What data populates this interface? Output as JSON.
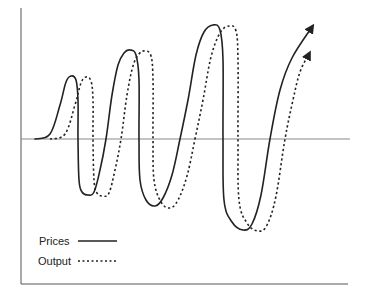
{
  "chart_data": {
    "type": "line",
    "title": "",
    "xlabel": "",
    "ylabel": "",
    "grid": false,
    "legend_position": "bottom-left inside",
    "axes": {
      "frame": "left and bottom borders",
      "zero_line": true
    },
    "series": [
      {
        "name": "Prices",
        "style": "solid",
        "color": "#222222",
        "arrow_end": true,
        "description": "Oscillation with growing amplitude, leading Output by about a quarter cycle",
        "peaks": [
          {
            "x": 71,
            "y": 76
          },
          {
            "x": 130,
            "y": 50
          },
          {
            "x": 213,
            "y": 25
          }
        ],
        "troughs": [
          {
            "x": 88,
            "y": 195
          },
          {
            "x": 155,
            "y": 206
          },
          {
            "x": 243,
            "y": 230
          }
        ],
        "points": [
          [
            35,
            139
          ],
          [
            50,
            134
          ],
          [
            60,
            105
          ],
          [
            66,
            82
          ],
          [
            71,
            76
          ],
          [
            76,
            80
          ],
          [
            78,
            100
          ],
          [
            78,
            139
          ],
          [
            79,
            180
          ],
          [
            82,
            192
          ],
          [
            88,
            195
          ],
          [
            94,
            192
          ],
          [
            100,
            170
          ],
          [
            106,
            139
          ],
          [
            112,
            95
          ],
          [
            118,
            65
          ],
          [
            124,
            53
          ],
          [
            130,
            50
          ],
          [
            136,
            55
          ],
          [
            139,
            80
          ],
          [
            139,
            139
          ],
          [
            140,
            180
          ],
          [
            146,
            200
          ],
          [
            155,
            206
          ],
          [
            163,
            198
          ],
          [
            172,
            175
          ],
          [
            180,
            139
          ],
          [
            188,
            100
          ],
          [
            196,
            55
          ],
          [
            204,
            32
          ],
          [
            213,
            25
          ],
          [
            220,
            30
          ],
          [
            223,
            60
          ],
          [
            223,
            139
          ],
          [
            224,
            200
          ],
          [
            232,
            222
          ],
          [
            243,
            230
          ],
          [
            252,
            224
          ],
          [
            261,
            195
          ],
          [
            270,
            139
          ],
          [
            280,
            90
          ],
          [
            292,
            58
          ],
          [
            312,
            27
          ]
        ]
      },
      {
        "name": "Output",
        "style": "dashed",
        "color": "#222222",
        "arrow_end": true,
        "description": "Oscillation with growing amplitude, lagging Prices by about a quarter cycle",
        "peaks": [
          {
            "x": 86,
            "y": 77
          },
          {
            "x": 145,
            "y": 51
          },
          {
            "x": 229,
            "y": 26
          }
        ],
        "troughs": [
          {
            "x": 103,
            "y": 196
          },
          {
            "x": 170,
            "y": 208
          },
          {
            "x": 258,
            "y": 231
          }
        ],
        "points": [
          [
            50,
            139
          ],
          [
            65,
            134
          ],
          [
            75,
            105
          ],
          [
            81,
            83
          ],
          [
            86,
            77
          ],
          [
            91,
            81
          ],
          [
            93,
            100
          ],
          [
            93,
            139
          ],
          [
            94,
            180
          ],
          [
            97,
            193
          ],
          [
            103,
            196
          ],
          [
            109,
            193
          ],
          [
            115,
            170
          ],
          [
            121,
            139
          ],
          [
            127,
            95
          ],
          [
            133,
            66
          ],
          [
            139,
            54
          ],
          [
            145,
            51
          ],
          [
            151,
            56
          ],
          [
            153,
            80
          ],
          [
            153,
            139
          ],
          [
            154,
            180
          ],
          [
            161,
            202
          ],
          [
            170,
            208
          ],
          [
            178,
            200
          ],
          [
            187,
            176
          ],
          [
            195,
            139
          ],
          [
            203,
            100
          ],
          [
            211,
            57
          ],
          [
            220,
            33
          ],
          [
            229,
            26
          ],
          [
            236,
            31
          ],
          [
            238,
            60
          ],
          [
            238,
            139
          ],
          [
            239,
            200
          ],
          [
            247,
            223
          ],
          [
            258,
            231
          ],
          [
            267,
            225
          ],
          [
            276,
            196
          ],
          [
            285,
            139
          ],
          [
            293,
            100
          ],
          [
            300,
            72
          ],
          [
            309,
            54
          ]
        ]
      }
    ],
    "legend": [
      {
        "label": "Prices",
        "style": "solid"
      },
      {
        "label": "Output",
        "style": "dashed"
      }
    ]
  },
  "legend": {
    "prices_label": "Prices",
    "output_label": "Output"
  },
  "colors": {
    "line": "#222222",
    "axis": "#888888",
    "frame": "#555555"
  }
}
